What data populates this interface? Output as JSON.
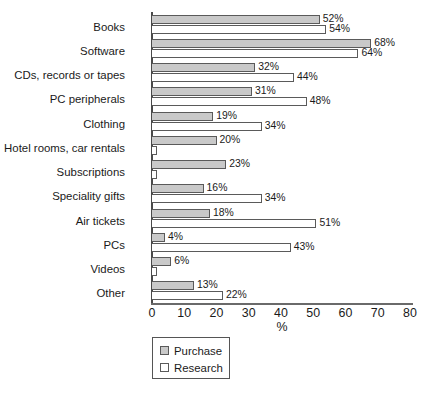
{
  "chart_data": {
    "type": "bar",
    "orientation": "horizontal",
    "title": "",
    "subtitle": "",
    "xlabel": "%",
    "ylabel": "",
    "xlim": [
      0,
      80
    ],
    "xticks": [
      0,
      10,
      20,
      30,
      40,
      50,
      60,
      70,
      80
    ],
    "xtick_labels": [
      "0",
      "10",
      "20",
      "30",
      "40",
      "50",
      "60",
      "70",
      "80"
    ],
    "grid": false,
    "legend_position": "bottom-left",
    "categories": [
      "Books",
      "Software",
      "CDs, records or tapes",
      "PC peripherals",
      "Clothing",
      "Hotel rooms, car rentals",
      "Subscriptions",
      "Speciality gifts",
      "Air tickets",
      "PCs",
      "Videos",
      "Other"
    ],
    "series": [
      {
        "name": "Purchase",
        "color": "#c9c9c9",
        "values": [
          52,
          68,
          32,
          31,
          19,
          20,
          23,
          16,
          18,
          4,
          6,
          13
        ],
        "labels": [
          "52%",
          "68%",
          "32%",
          "31%",
          "19%",
          "20%",
          "23%",
          "16%",
          "18%",
          "4%",
          "6%",
          "13%"
        ]
      },
      {
        "name": "Research",
        "color": "#ffffff",
        "values": [
          54,
          64,
          44,
          48,
          34,
          1.5,
          1.5,
          34,
          51,
          43,
          1.5,
          22
        ],
        "labels": [
          "54%",
          "64%",
          "44%",
          "48%",
          "34%",
          "",
          "",
          "34%",
          "51%",
          "43%",
          "",
          "22%"
        ]
      }
    ]
  },
  "legend": {
    "items": [
      {
        "label": "Purchase",
        "swatch": "purchase"
      },
      {
        "label": "Research",
        "swatch": "research"
      }
    ]
  }
}
